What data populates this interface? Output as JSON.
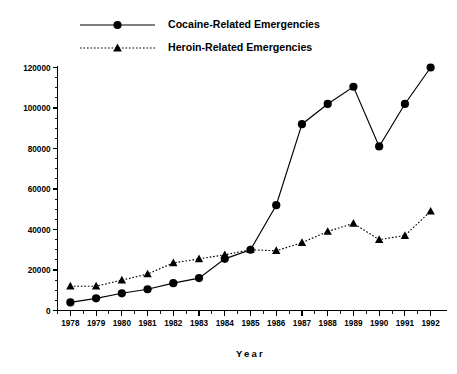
{
  "chart_data": {
    "type": "line",
    "title": "",
    "xlabel": "Year",
    "ylabel": "",
    "grid": false,
    "legend_position": "top-left",
    "categories": [
      "1978",
      "1979",
      "1980",
      "1981",
      "1982",
      "1983",
      "1984",
      "1985",
      "1986",
      "1987",
      "1988",
      "1989",
      "1990",
      "1991",
      "1992"
    ],
    "x": [
      1978,
      1979,
      1980,
      1981,
      1982,
      1983,
      1984,
      1985,
      1986,
      1987,
      1988,
      1989,
      1990,
      1991,
      1992
    ],
    "xlim": [
      1977.5,
      1992.5
    ],
    "ylim": [
      0,
      120000
    ],
    "ytick_labels": [
      "0",
      "20000",
      "40000",
      "60000",
      "80000",
      "100000",
      "120000"
    ],
    "ytick_values": [
      0,
      20000,
      40000,
      60000,
      80000,
      100000,
      120000
    ],
    "yminor_step": 5000,
    "series": [
      {
        "name": "Cocaine-Related Emergencies",
        "marker": "circle",
        "line_style": "solid",
        "color": "#000000",
        "values": [
          4000,
          6000,
          8500,
          10500,
          13500,
          16000,
          25500,
          30000,
          52000,
          92000,
          102000,
          110500,
          81000,
          102000,
          120000
        ]
      },
      {
        "name": "Heroin-Related Emergencies",
        "marker": "triangle",
        "line_style": "dotted",
        "color": "#000000",
        "values": [
          12000,
          12000,
          15000,
          18000,
          23500,
          25500,
          27500,
          30000,
          29500,
          33500,
          39000,
          43000,
          35000,
          37000,
          49000
        ]
      }
    ]
  },
  "legend": {
    "items": [
      {
        "label": "Cocaine-Related Emergencies",
        "marker": "circle",
        "line_style": "solid"
      },
      {
        "label": "Heroin-Related Emergencies",
        "marker": "triangle",
        "line_style": "dotted"
      }
    ]
  },
  "axes": {
    "x_axis_title": "Year"
  }
}
